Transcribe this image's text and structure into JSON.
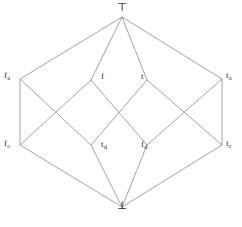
{
  "diagram": {
    "kind": "hasse-diagram",
    "line_color": "#8a8a8a",
    "label_color": "#2b2b2b",
    "background_color": "#ffffff",
    "nodes": [
      {
        "id": "top",
        "label": "⊤",
        "sub": "",
        "x": 122,
        "y": 17,
        "label_x": 117,
        "label_y": 2,
        "kind": "bound"
      },
      {
        "id": "fa",
        "label": "f",
        "sub": "a",
        "x": 20,
        "y": 79,
        "label_x": 4,
        "label_y": 71,
        "kind": "value"
      },
      {
        "id": "f",
        "label": "f",
        "sub": "",
        "x": 91,
        "y": 80,
        "label_x": 101,
        "label_y": 72,
        "kind": "value"
      },
      {
        "id": "t",
        "label": "t",
        "sub": "",
        "x": 147,
        "y": 80,
        "label_x": 141,
        "label_y": 72,
        "kind": "value"
      },
      {
        "id": "ta",
        "label": "t",
        "sub": "a",
        "x": 222,
        "y": 79,
        "label_x": 226,
        "label_y": 71,
        "kind": "value"
      },
      {
        "id": "fc",
        "label": "f",
        "sub": "c",
        "x": 20,
        "y": 145,
        "label_x": 4,
        "label_y": 139,
        "kind": "value"
      },
      {
        "id": "td",
        "label": "t",
        "sub": "d",
        "x": 91,
        "y": 145,
        "label_x": 101,
        "label_y": 140,
        "kind": "value"
      },
      {
        "id": "fd",
        "label": "f",
        "sub": "d",
        "x": 147,
        "y": 145,
        "label_x": 141,
        "label_y": 140,
        "kind": "value"
      },
      {
        "id": "tc",
        "label": "t",
        "sub": "c",
        "x": 222,
        "y": 145,
        "label_x": 226,
        "label_y": 139,
        "kind": "value"
      },
      {
        "id": "bot",
        "label": "⊥",
        "sub": "",
        "x": 122,
        "y": 207,
        "label_x": 117,
        "label_y": 200,
        "kind": "bound"
      }
    ],
    "edges": [
      {
        "from": "top",
        "to": "fa"
      },
      {
        "from": "top",
        "to": "f"
      },
      {
        "from": "top",
        "to": "t"
      },
      {
        "from": "top",
        "to": "ta"
      },
      {
        "from": "fa",
        "to": "fc"
      },
      {
        "from": "fa",
        "to": "td"
      },
      {
        "from": "f",
        "to": "fc"
      },
      {
        "from": "f",
        "to": "fd"
      },
      {
        "from": "t",
        "to": "td"
      },
      {
        "from": "t",
        "to": "tc"
      },
      {
        "from": "ta",
        "to": "fd"
      },
      {
        "from": "ta",
        "to": "tc"
      },
      {
        "from": "fc",
        "to": "bot"
      },
      {
        "from": "td",
        "to": "bot"
      },
      {
        "from": "fd",
        "to": "bot"
      },
      {
        "from": "tc",
        "to": "bot"
      }
    ]
  }
}
